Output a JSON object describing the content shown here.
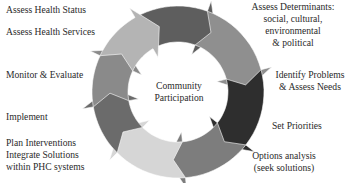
{
  "diagram": {
    "hub": {
      "line1": "Community",
      "line2": "Participation"
    },
    "labels": {
      "assess_health_status": "Assess Health Status",
      "assess_health_services": "Assess Health Services",
      "monitor_evaluate": "Monitor & Evaluate",
      "implement": "Implement",
      "plan_interventions": {
        "line1": "Plan Interventions",
        "line2": "Integrate Solutions",
        "line3": "within PHC systems"
      },
      "assess_determinants": {
        "line1": "Assess Determinants:",
        "line2": "social, cultural,",
        "line3": "environmental",
        "line4": "& political"
      },
      "identify_problems": {
        "line1": "Identify Problems",
        "line2": "& Assess Needs"
      },
      "set_priorities": "Set Priorities",
      "options_analysis": {
        "line1": "Options analysis",
        "line2": "(seek solutions)"
      }
    },
    "segment_colors": {
      "top": "#5e5e5e",
      "upper_right": "#8f8f8f",
      "right": "#2e2e2e",
      "lower_right": "#7d7d7d",
      "bottom": "#d6d6d6",
      "lower_left": "#6b6b6b",
      "left": "#8a8a8a",
      "upper_left": "#b4b4b4"
    }
  }
}
